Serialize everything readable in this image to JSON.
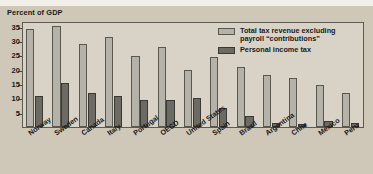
{
  "figure": {
    "axis_title": "Percent of GDP",
    "background_color": "#cfc8b8",
    "plot_background_color": "#d8d3c6",
    "frame_color": "#5d5a52"
  },
  "legend": {
    "position": "top-right",
    "entries": [
      {
        "label": "Total tax revenue excluding payroll “contributions”",
        "color": "#b5b2aa",
        "swatch": "light-gray-swatch"
      },
      {
        "label": "Personal income tax",
        "color": "#6d6a63",
        "swatch": "dark-gray-swatch"
      }
    ]
  },
  "chart_data": {
    "type": "bar",
    "title": "",
    "subtitle": "",
    "xlabel": "",
    "ylabel": "Percent of GDP",
    "ylim": [
      0,
      37
    ],
    "yticks": [
      5,
      10,
      15,
      20,
      25,
      30,
      35
    ],
    "grid": false,
    "legend_position": "top-right",
    "categories": [
      "Norway",
      "Sweden",
      "Canada",
      "Italy",
      "Portugal",
      "OECD",
      "United States",
      "Spain",
      "Brazil",
      "Argentina",
      "Chile",
      "Mexico",
      "Peru"
    ],
    "series": [
      {
        "name": "Total tax revenue excluding payroll “contributions”",
        "color": "#b5b2aa",
        "values": [
          34.1,
          35.1,
          28.9,
          31.5,
          24.7,
          28.0,
          19.8,
          24.6,
          21.1,
          18.0,
          17.0,
          14.8,
          12.0
        ]
      },
      {
        "name": "Personal income tax",
        "color": "#6d6a63",
        "values": [
          10.7,
          15.2,
          11.8,
          10.8,
          9.3,
          9.3,
          10.0,
          6.8,
          4.0,
          1.3,
          1.0,
          2.1,
          1.3
        ]
      }
    ]
  }
}
